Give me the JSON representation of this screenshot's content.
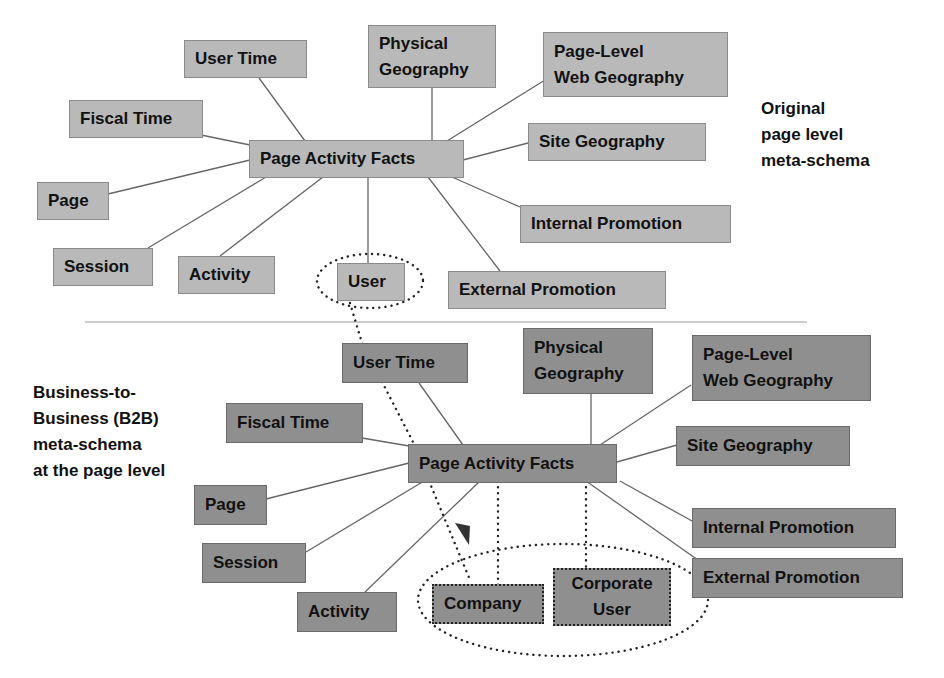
{
  "diagram": {
    "top": {
      "caption": "Original\npage level\nmeta-schema",
      "center": "Page Activity Facts",
      "nodes": {
        "user_time": "User Time",
        "physical_geography": "Physical\nGeography",
        "page_level_web_geography": "Page-Level\nWeb Geography",
        "fiscal_time": "Fiscal Time",
        "site_geography": "Site Geography",
        "page": "Page",
        "internal_promotion": "Internal Promotion",
        "session": "Session",
        "activity": "Activity",
        "user": "User",
        "external_promotion": "External Promotion"
      }
    },
    "bottom": {
      "caption": "Business-to-\nBusiness (B2B)\nmeta-schema\nat the page level",
      "center": "Page Activity Facts",
      "nodes": {
        "user_time": "User Time",
        "physical_geography": "Physical\nGeography",
        "page_level_web_geography": "Page-Level\nWeb Geography",
        "fiscal_time": "Fiscal Time",
        "site_geography": "Site Geography",
        "page": "Page",
        "internal_promotion": "Internal Promotion",
        "session": "Session",
        "external_promotion": "External Promotion",
        "activity": "Activity",
        "company": "Company",
        "corporate_user": "Corporate\nUser"
      }
    },
    "colors": {
      "top_node_fill": "#b9b9b9",
      "bottom_node_fill": "#8f8f8f",
      "line": "#555555"
    }
  }
}
